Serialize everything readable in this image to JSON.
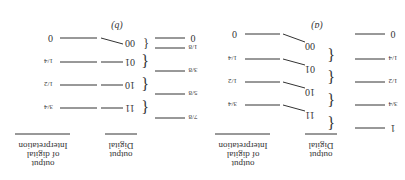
{
  "panels": [
    {
      "label": "(a)",
      "input_levels": [
        "0",
        "1/4",
        "1/2",
        "3/4",
        "1"
      ],
      "codes": [
        "00",
        "01",
        "10",
        "11"
      ],
      "interpretations": [
        "0",
        "1/4",
        "1/2",
        "3/4"
      ],
      "col_digital": [
        "Digital",
        "output"
      ],
      "col_interp": [
        "Interpretation",
        "of digital",
        "output"
      ]
    },
    {
      "label": "(b)",
      "input_levels": [
        "0",
        "1/8",
        "3/8",
        "5/8",
        "7/8"
      ],
      "codes": [
        "00",
        "01",
        "10",
        "11"
      ],
      "interpretations": [
        "0",
        "1/4",
        "1/2",
        "3/4"
      ],
      "col_digital": [
        "Digital",
        "output"
      ],
      "col_interp": [
        "Interpretation",
        "of digital",
        "output"
      ]
    }
  ],
  "orientation": "rotated 180 degrees"
}
